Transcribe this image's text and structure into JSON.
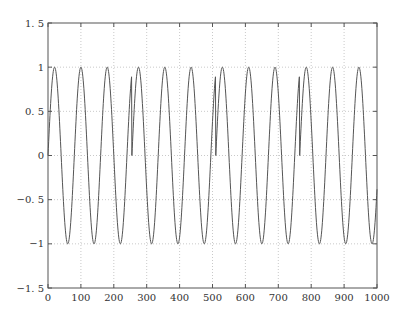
{
  "chart_data": {
    "type": "line",
    "title": "",
    "xlabel": "",
    "ylabel": "",
    "xlim": [
      0,
      1000
    ],
    "ylim": [
      -1.5,
      1.5
    ],
    "xticks": [
      0,
      100,
      200,
      300,
      400,
      500,
      600,
      700,
      800,
      900,
      1000
    ],
    "yticks": [
      -1.5,
      -1,
      -0.5,
      0,
      0.5,
      1,
      1.5
    ],
    "ytick_labels": [
      "-1.5",
      "-0.5",
      "0",
      "0.5",
      "1",
      "1.5"
    ],
    "grid": true,
    "series": [
      {
        "name": "signal",
        "description": "sine wave, period ~80 samples, amplitude 1, phase resets at n=255, 510, 765",
        "period": 80,
        "amplitude": 1,
        "reset_points": [
          0,
          255,
          510,
          765
        ],
        "n_range": [
          0,
          1000
        ],
        "color": "#555555"
      }
    ]
  }
}
